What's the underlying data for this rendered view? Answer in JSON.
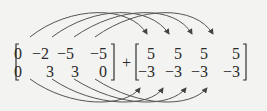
{
  "equation": {
    "left_matrix": {
      "rows": [
        [
          "0",
          "-2",
          "-5",
          "-5"
        ],
        [
          "0",
          "3",
          "3",
          "0"
        ]
      ]
    },
    "operator": "+",
    "right_matrix": {
      "rows": [
        [
          "5",
          "5",
          "5",
          "5"
        ],
        [
          "-3",
          "-3",
          "-3",
          "-3"
        ]
      ]
    }
  },
  "arrows": {
    "top_count": 4,
    "bottom_count": 4,
    "color": "#4a4a4a",
    "description": "Curved arrows map each column of the left matrix to the corresponding column of the right matrix; top arrows arc above to the first row, bottom arrows arc below to the second row."
  },
  "colors": {
    "background": "#f3f3f1",
    "text": "#2a2a2a"
  }
}
